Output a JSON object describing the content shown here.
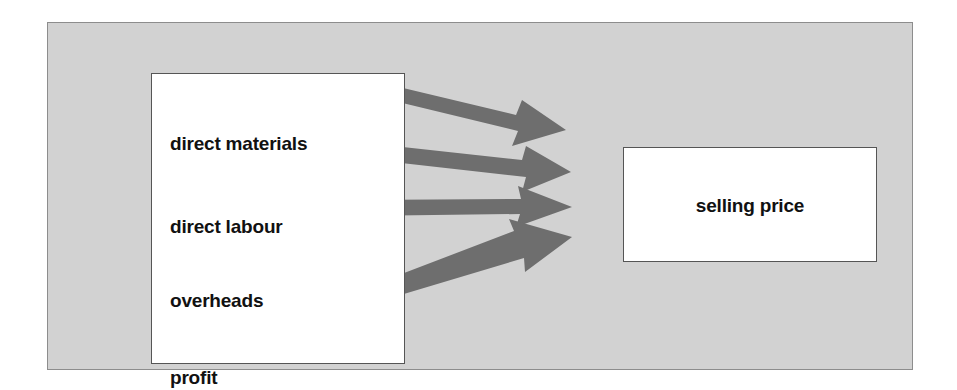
{
  "diagram": {
    "background_color": "#d2d2d2",
    "arrow_color": "#6e6e6e",
    "box_fill": "#ffffff",
    "box_border": "#555555",
    "text_color": "#111111",
    "source_box": {
      "name": "cost components",
      "items": [
        {
          "label": "direct materials"
        },
        {
          "label": "direct labour"
        },
        {
          "label": "overheads"
        },
        {
          "label": "profit"
        }
      ]
    },
    "target_box": {
      "label": "selling price"
    },
    "connections": [
      {
        "from": "direct materials",
        "to": "selling price"
      },
      {
        "from": "direct labour",
        "to": "selling price"
      },
      {
        "from": "overheads",
        "to": "selling price"
      },
      {
        "from": "profit",
        "to": "selling price"
      }
    ]
  }
}
